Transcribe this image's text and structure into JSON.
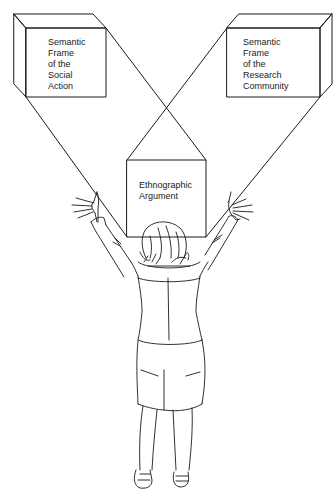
{
  "diagram": {
    "boxes": [
      {
        "id": "left",
        "label": "Semantic\nFrame\nof the\nSocial\nAction"
      },
      {
        "id": "right",
        "label": "Semantic\nFrame\nof the\nResearch\nCommunity"
      },
      {
        "id": "center",
        "label": "Ethnographic\nArgument"
      }
    ],
    "figure": "person-with-raised-arms-viewed-from-behind",
    "colors": {
      "line": "#1a1a1a",
      "background": "#ffffff"
    }
  }
}
